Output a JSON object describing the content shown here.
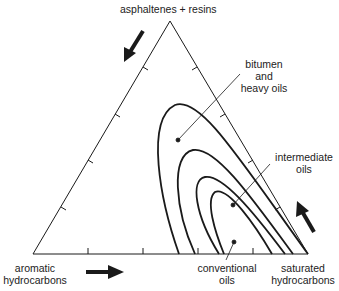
{
  "diagram": {
    "type": "ternary",
    "vertices": {
      "top": "asphaltenes + resins",
      "bottom_left": [
        "aromatic",
        "hydrocarbons"
      ],
      "bottom_right": [
        "saturated",
        "hydrocarbons"
      ]
    },
    "regions": [
      {
        "name": "bitumen and heavy oils",
        "label": [
          "bitumen",
          "and",
          "heavy oils"
        ]
      },
      {
        "name": "intermediate oils",
        "label": [
          "intermediate",
          "oils"
        ]
      },
      {
        "name": "conventional oils",
        "label": [
          "conventional",
          "oils"
        ]
      }
    ],
    "arrows": [
      {
        "position": "left-edge",
        "direction": "down-left"
      },
      {
        "position": "bottom-edge",
        "direction": "right"
      },
      {
        "position": "right-edge",
        "direction": "up-left"
      }
    ],
    "ticks_per_edge": 4,
    "colors": {
      "line": "#1a1a1a",
      "background": "#ffffff"
    }
  }
}
